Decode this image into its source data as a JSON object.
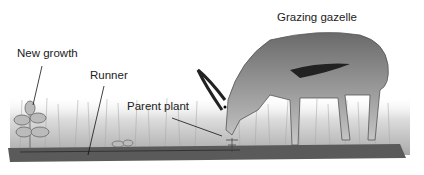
{
  "labels": {
    "gazelle": "Grazing gazelle",
    "new_growth": "New growth",
    "runner": "Runner",
    "parent_plant": "Parent plant"
  }
}
